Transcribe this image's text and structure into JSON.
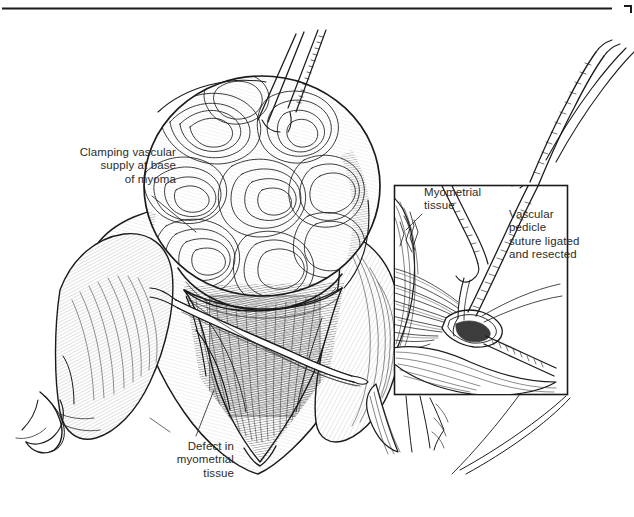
{
  "figure": {
    "type": "line-art medical illustration",
    "ink_color": "#1b1b1b",
    "text_color": "#2b2b2b",
    "background": "#ffffff"
  },
  "rules": {
    "top_rule": "horizontal rule across top of plate",
    "corner_mark": "small corner tick at top right"
  },
  "labels": {
    "clamping": "Clamping vascular\nsupply at base\nof myoma",
    "defect": "Defect in\nmyometrial\ntissue",
    "myometrial": "Myometrial\ntissue",
    "pedicle": "Vascular\npedicle\nsuture ligated\nand resected"
  },
  "inset": {
    "name": "vascular-pedicle-inset",
    "frame": {
      "x": 394,
      "y": 185,
      "width": 174,
      "height": 210
    }
  },
  "anatomy": {
    "myoma": "large whorled fibroid nodule elevated by tenaculum",
    "uterus": "uterine corpus with hatched serosal shading",
    "defect_cavity": "V-shaped myometrial defect after enucleation",
    "round_ligament": "round ligament at lower left",
    "clamp": "curved hemostat clamp across vascular base",
    "tenaculum": "two instrument shafts entering from top",
    "inset_clamp": "hemostat on vascular pedicle",
    "inset_needle": "curved needle with suture",
    "inset_pedicle": "fan of vascular pedicle fibers"
  }
}
